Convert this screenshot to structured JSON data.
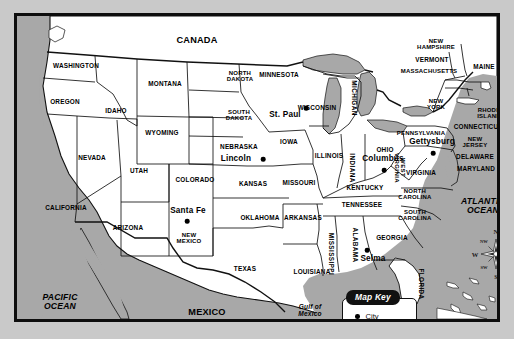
{
  "map": {
    "title": "United States political map with selected cities",
    "colors": {
      "land": "#ffffff",
      "water": "#a8a8a8",
      "border": "#0d0d0d",
      "page_background": "#c9c9c9",
      "key_title_background": "#111111",
      "key_title_text": "#ffffff"
    },
    "countries": [
      {
        "name": "CANADA",
        "x": 180,
        "y": 25
      },
      {
        "name": "MEXICO",
        "x": 190,
        "y": 297
      }
    ],
    "oceans": [
      {
        "name": "PACIFIC\nOCEAN",
        "x": 43,
        "y": 286
      },
      {
        "name": "ATLANTIC\nOCEAN",
        "x": 466,
        "y": 190
      },
      {
        "name": "Gulf of\nMexico",
        "x": 293,
        "y": 295
      }
    ],
    "states": [
      {
        "name": "WASHINGTON",
        "x": 59,
        "y": 50
      },
      {
        "name": "OREGON",
        "x": 48,
        "y": 86
      },
      {
        "name": "IDAHO",
        "x": 99,
        "y": 95
      },
      {
        "name": "MONTANA",
        "x": 148,
        "y": 68
      },
      {
        "name": "NORTH\nDAKOTA",
        "x": 223,
        "y": 60
      },
      {
        "name": "SOUTH\nDAKOTA",
        "x": 222,
        "y": 99
      },
      {
        "name": "MINNESOTA",
        "x": 262,
        "y": 59
      },
      {
        "name": "WISCONSIN",
        "x": 300,
        "y": 92
      },
      {
        "name": "WYOMING",
        "x": 145,
        "y": 117
      },
      {
        "name": "NEVADA",
        "x": 75,
        "y": 142
      },
      {
        "name": "UTAH",
        "x": 122,
        "y": 155
      },
      {
        "name": "COLORADO",
        "x": 178,
        "y": 164
      },
      {
        "name": "NEBRASKA",
        "x": 222,
        "y": 131
      },
      {
        "name": "IOWA",
        "x": 272,
        "y": 126
      },
      {
        "name": "ILLINOIS",
        "x": 312,
        "y": 140
      },
      {
        "name": "KANSAS",
        "x": 236,
        "y": 168
      },
      {
        "name": "MISSOURI",
        "x": 282,
        "y": 167
      },
      {
        "name": "CALIFORNIA",
        "x": 49,
        "y": 192
      },
      {
        "name": "ARIZONA",
        "x": 111,
        "y": 212
      },
      {
        "name": "NEW\nMEXICO",
        "x": 172,
        "y": 222
      },
      {
        "name": "OKLAHOMA",
        "x": 243,
        "y": 202
      },
      {
        "name": "ARKANSAS",
        "x": 286,
        "y": 202
      },
      {
        "name": "TEXAS",
        "x": 228,
        "y": 253
      },
      {
        "name": "LOUISIANA",
        "x": 295,
        "y": 256
      },
      {
        "name": "MISSISSIPPI",
        "x": 314,
        "y": 238,
        "rotated": true
      },
      {
        "name": "ALABAMA",
        "x": 338,
        "y": 229,
        "rotated": true
      },
      {
        "name": "TENNESSEE",
        "x": 345,
        "y": 189
      },
      {
        "name": "KENTUCKY",
        "x": 348,
        "y": 172
      },
      {
        "name": "INDIANA",
        "x": 335,
        "y": 152,
        "rotated": true
      },
      {
        "name": "OHIO",
        "x": 368,
        "y": 134
      },
      {
        "name": "MICHIGAN",
        "x": 337,
        "y": 82,
        "rotated": true
      },
      {
        "name": "GEORGIA",
        "x": 375,
        "y": 222
      },
      {
        "name": "FLORIDA",
        "x": 404,
        "y": 268,
        "rotated": true
      },
      {
        "name": "SOUTH\nCAROLINA",
        "x": 398,
        "y": 199
      },
      {
        "name": "NORTH\nCAROLINA",
        "x": 398,
        "y": 178
      },
      {
        "name": "VIRGINIA",
        "x": 404,
        "y": 157
      },
      {
        "name": "WEST\nVIRGINIA",
        "x": 383,
        "y": 152,
        "rotated": true
      },
      {
        "name": "PENNSYLVANIA",
        "x": 404,
        "y": 117
      },
      {
        "name": "NEW\nYORK",
        "x": 419,
        "y": 88
      },
      {
        "name": "MARYLAND",
        "x": 459,
        "y": 153
      },
      {
        "name": "DELAWARE",
        "x": 458,
        "y": 141
      },
      {
        "name": "NEW\nJERSEY",
        "x": 458,
        "y": 126
      },
      {
        "name": "CONNECTICUT",
        "x": 461,
        "y": 111
      },
      {
        "name": "RHODE\nISLAND",
        "x": 472,
        "y": 97
      },
      {
        "name": "MASSACHUSETTS",
        "x": 412,
        "y": 55
      },
      {
        "name": "VERMONT",
        "x": 415,
        "y": 44
      },
      {
        "name": "NEW\nHAMPSHIRE",
        "x": 419,
        "y": 28
      },
      {
        "name": "MAINE",
        "x": 467,
        "y": 51
      }
    ],
    "cities": [
      {
        "name": "St. Paul",
        "label_x": 268,
        "label_y": 99,
        "dot_x": 289,
        "dot_y": 92
      },
      {
        "name": "Lincoln",
        "label_x": 219,
        "label_y": 143,
        "dot_x": 246,
        "dot_y": 143
      },
      {
        "name": "Columbus",
        "label_x": 366,
        "label_y": 143,
        "dot_x": 367,
        "dot_y": 154
      },
      {
        "name": "Gettysburg",
        "label_x": 415,
        "label_y": 126,
        "dot_x": 416,
        "dot_y": 137
      },
      {
        "name": "Santa Fe",
        "label_x": 171,
        "label_y": 195,
        "dot_x": 170,
        "dot_y": 205
      },
      {
        "name": "Selma",
        "label_x": 356,
        "label_y": 243,
        "dot_x": 350,
        "dot_y": 234
      }
    ],
    "map_key": {
      "title": "Map Key",
      "items": [
        {
          "symbol": "dot",
          "label": "City"
        }
      ]
    },
    "compass": {
      "directions": [
        {
          "label": "N",
          "x": 27,
          "y": 6,
          "size": "main"
        },
        {
          "label": "S",
          "x": 27,
          "y": 51,
          "size": "main"
        },
        {
          "label": "E",
          "x": 48,
          "y": 29,
          "size": "main"
        },
        {
          "label": "W",
          "x": 6,
          "y": 29,
          "size": "main"
        },
        {
          "label": "NE",
          "x": 38,
          "y": 16,
          "size": "sub"
        },
        {
          "label": "NW",
          "x": 15,
          "y": 16,
          "size": "sub"
        },
        {
          "label": "SE",
          "x": 38,
          "y": 42,
          "size": "sub"
        },
        {
          "label": "SW",
          "x": 15,
          "y": 42,
          "size": "sub"
        }
      ]
    }
  }
}
